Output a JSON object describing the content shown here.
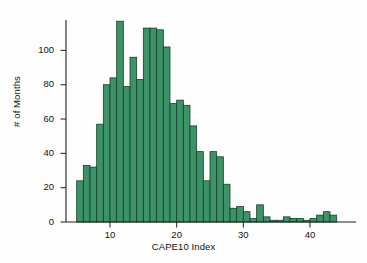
{
  "figure": {
    "background_color": "#fdfdfd",
    "bar_fill_color": "#3d9268",
    "bar_edge_color": "#14402c",
    "axis_color": "#22201e",
    "text_color": "#15120f"
  },
  "chart_data": {
    "type": "bar",
    "title": "",
    "subtitle": "",
    "xlabel": "CAPE10 Index",
    "ylabel": "# of Months",
    "xlim": [
      4,
      45
    ],
    "ylim": [
      0,
      118
    ],
    "grid": false,
    "legend": null,
    "bin_width": 1,
    "x_ticks": [
      10,
      20,
      30,
      40
    ],
    "x_tick_labels": [
      "10",
      "20",
      "30",
      "40"
    ],
    "y_ticks": [
      0,
      20,
      40,
      60,
      80,
      100
    ],
    "y_tick_labels": [
      "0",
      "20",
      "40",
      "60",
      "80",
      "100"
    ],
    "bin_starts": [
      5,
      6,
      7,
      8,
      9,
      10,
      11,
      12,
      13,
      14,
      15,
      16,
      17,
      18,
      19,
      20,
      21,
      22,
      23,
      24,
      25,
      26,
      27,
      28,
      29,
      30,
      31,
      32,
      33,
      34,
      35,
      36,
      37,
      38,
      39,
      40,
      41,
      42,
      43
    ],
    "categories": [
      "5-6",
      "6-7",
      "7-8",
      "8-9",
      "9-10",
      "10-11",
      "11-12",
      "12-13",
      "13-14",
      "14-15",
      "15-16",
      "16-17",
      "17-18",
      "18-19",
      "19-20",
      "20-21",
      "21-22",
      "22-23",
      "23-24",
      "24-25",
      "25-26",
      "26-27",
      "27-28",
      "28-29",
      "29-30",
      "30-31",
      "31-32",
      "32-33",
      "33-34",
      "34-35",
      "35-36",
      "36-37",
      "37-38",
      "38-39",
      "39-40",
      "40-41",
      "41-42",
      "42-43",
      "43-44"
    ],
    "values": [
      24,
      33,
      32,
      57,
      80,
      84,
      117,
      79,
      96,
      83,
      113,
      113,
      112,
      102,
      69,
      71,
      68,
      56,
      41,
      24,
      41,
      38,
      22,
      8,
      9,
      6,
      2,
      10,
      3,
      1,
      1,
      3,
      2,
      2,
      1,
      2,
      4,
      6,
      4
    ]
  }
}
